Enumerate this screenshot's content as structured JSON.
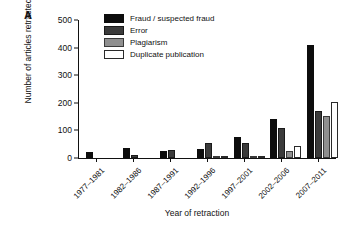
{
  "panel": {
    "label": "A"
  },
  "chart_data": {
    "type": "bar",
    "title": "",
    "xlabel": "Year of retraction",
    "ylabel": "Number of articles retracted",
    "categories": [
      "1977–1981",
      "1982–1986",
      "1987–1991",
      "1992–1996",
      "1997–2001",
      "2002–2006",
      "2007–2011"
    ],
    "series": [
      {
        "name": "Fraud / suspected fraud",
        "color": "#0d0d0d",
        "values": [
          20,
          35,
          27,
          33,
          77,
          140,
          408
        ]
      },
      {
        "name": "Error",
        "color": "#3b3b3b",
        "values": [
          0,
          11,
          30,
          55,
          56,
          107,
          170
        ]
      },
      {
        "name": "Plagiarism",
        "color": "#8f8f8f",
        "values": [
          0,
          0,
          0,
          4,
          7,
          27,
          151
        ]
      },
      {
        "name": "Duplicate publication",
        "color": "#ffffff",
        "values": [
          0,
          0,
          0,
          5,
          7,
          42,
          203
        ]
      }
    ],
    "ylim": [
      0,
      500
    ],
    "yticks": [
      0,
      100,
      200,
      300,
      400,
      500
    ],
    "grid": false,
    "legend_position": "top-left"
  }
}
